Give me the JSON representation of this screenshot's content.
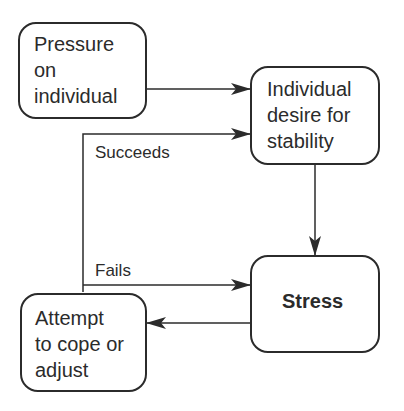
{
  "diagram": {
    "nodes": [
      {
        "id": "pressure",
        "label": "Pressure\non\nindividual"
      },
      {
        "id": "desire",
        "label": "Individual\ndesire for\nstability"
      },
      {
        "id": "stress",
        "label": "Stress"
      },
      {
        "id": "attempt",
        "label": "Attempt\nto cope or\nadjust"
      }
    ],
    "edges": [
      {
        "from": "pressure",
        "to": "desire",
        "label": ""
      },
      {
        "from": "attempt",
        "to": "desire",
        "label": "Succeeds"
      },
      {
        "from": "desire",
        "to": "stress",
        "label": ""
      },
      {
        "from": "attempt",
        "to": "stress",
        "label": "Fails"
      },
      {
        "from": "stress",
        "to": "attempt",
        "label": ""
      }
    ],
    "colors": {
      "stroke": "#2b2b2b",
      "background": "#ffffff"
    }
  }
}
